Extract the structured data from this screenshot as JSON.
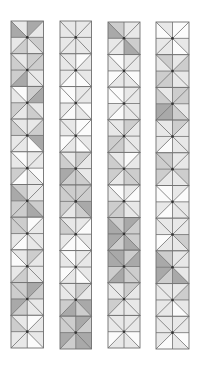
{
  "figure": {
    "shade_colors": [
      "#fbfbfb",
      "#e8e8e8",
      "#cdcdcd",
      "#a9a9a9"
    ],
    "line_color": "#6f6f6f",
    "center_dot_color": "#333333",
    "squares_per_strip": 10,
    "triangle_order": [
      "top-left",
      "top-right",
      "right-top",
      "right-bottom",
      "bottom-right",
      "bottom-left",
      "left-bottom",
      "left-top"
    ],
    "strips": [
      {
        "x": 11,
        "y": 21,
        "w": 32.5,
        "h": 32.7,
        "squares": [
          [
            1,
            3,
            1,
            2,
            1,
            2,
            1,
            3
          ],
          [
            1,
            2,
            2,
            1,
            1,
            3,
            2,
            2
          ],
          [
            0,
            2,
            3,
            1,
            2,
            1,
            2,
            1
          ],
          [
            1,
            1,
            2,
            3,
            0,
            1,
            1,
            2
          ],
          [
            0,
            1,
            1,
            0,
            1,
            0,
            2,
            1
          ],
          [
            2,
            1,
            1,
            2,
            3,
            2,
            2,
            3
          ],
          [
            2,
            0,
            1,
            1,
            1,
            0,
            1,
            2
          ],
          [
            1,
            2,
            1,
            1,
            1,
            2,
            1,
            0
          ],
          [
            2,
            3,
            2,
            1,
            1,
            2,
            3,
            2
          ],
          [
            1,
            0,
            1,
            1,
            0,
            1,
            1,
            2
          ]
        ]
      },
      {
        "x": 60,
        "y": 21,
        "w": 31.5,
        "h": 32.8,
        "squares": [
          [
            1,
            1,
            1,
            1,
            1,
            1,
            1,
            1
          ],
          [
            1,
            0,
            1,
            1,
            0,
            0,
            1,
            1
          ],
          [
            0,
            1,
            1,
            0,
            1,
            0,
            1,
            0
          ],
          [
            1,
            0,
            0,
            1,
            0,
            1,
            0,
            1
          ],
          [
            1,
            2,
            1,
            1,
            2,
            2,
            3,
            2
          ],
          [
            2,
            2,
            2,
            3,
            2,
            1,
            2,
            2
          ],
          [
            1,
            1,
            0,
            1,
            0,
            0,
            1,
            2
          ],
          [
            0,
            1,
            1,
            1,
            0,
            1,
            0,
            1
          ],
          [
            1,
            2,
            1,
            3,
            2,
            3,
            2,
            1
          ],
          [
            2,
            3,
            2,
            3,
            3,
            2,
            3,
            2
          ]
        ]
      },
      {
        "x": 108,
        "y": 22,
        "w": 32,
        "h": 32.6,
        "squares": [
          [
            2,
            1,
            1,
            2,
            3,
            1,
            1,
            3
          ],
          [
            0,
            1,
            1,
            0,
            1,
            1,
            0,
            1
          ],
          [
            0,
            1,
            1,
            1,
            1,
            0,
            1,
            0
          ],
          [
            1,
            2,
            1,
            1,
            1,
            2,
            2,
            1
          ],
          [
            1,
            0,
            1,
            2,
            2,
            1,
            2,
            2
          ],
          [
            0,
            1,
            0,
            1,
            1,
            2,
            2,
            1
          ],
          [
            2,
            3,
            2,
            2,
            3,
            2,
            3,
            3
          ],
          [
            3,
            2,
            3,
            2,
            2,
            3,
            2,
            3
          ],
          [
            1,
            2,
            1,
            1,
            1,
            1,
            2,
            1
          ],
          [
            1,
            1,
            1,
            0,
            1,
            1,
            0,
            1
          ]
        ]
      },
      {
        "x": 156,
        "y": 22,
        "w": 33,
        "h": 32.7,
        "squares": [
          [
            1,
            0,
            0,
            1,
            0,
            1,
            1,
            0
          ],
          [
            2,
            1,
            2,
            1,
            1,
            2,
            2,
            1
          ],
          [
            1,
            2,
            2,
            1,
            2,
            3,
            3,
            2
          ],
          [
            1,
            2,
            1,
            1,
            1,
            0,
            1,
            1
          ],
          [
            2,
            1,
            1,
            2,
            1,
            1,
            2,
            2
          ],
          [
            0,
            1,
            0,
            1,
            1,
            0,
            1,
            0
          ],
          [
            1,
            1,
            1,
            2,
            1,
            1,
            0,
            1
          ],
          [
            2,
            1,
            1,
            1,
            3,
            2,
            3,
            3
          ],
          [
            1,
            1,
            2,
            1,
            0,
            1,
            1,
            1
          ],
          [
            1,
            1,
            1,
            0,
            1,
            0,
            1,
            1
          ]
        ]
      }
    ]
  }
}
